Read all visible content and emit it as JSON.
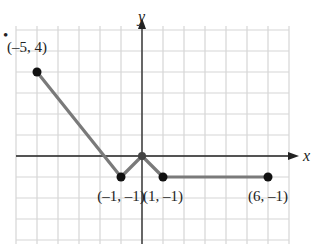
{
  "problem_marker": "•",
  "chart_data": {
    "type": "line",
    "title": "",
    "xlabel": "x",
    "ylabel": "y",
    "xlim": [
      -6,
      7
    ],
    "ylim": [
      -4,
      6
    ],
    "grid": true,
    "series": [
      {
        "name": "piecewise graph",
        "x": [
          -5,
          -1,
          0,
          1,
          6
        ],
        "y": [
          4,
          -1,
          0,
          -1,
          -1
        ],
        "color": "#777777"
      }
    ],
    "labeled_points": [
      {
        "x": -5,
        "y": 4,
        "label": "(–5, 4)"
      },
      {
        "x": -1,
        "y": -1,
        "label": "(–1, –1)"
      },
      {
        "x": 1,
        "y": -1,
        "label": "(1, –1)"
      },
      {
        "x": 6,
        "y": -1,
        "label": "(6, –1)"
      }
    ],
    "unlabeled_points": [
      {
        "x": 0,
        "y": 0
      }
    ]
  },
  "colors": {
    "grid": "#d6d6d6",
    "axis": "#222222",
    "line": "#7a7a7a",
    "point": "#111111"
  }
}
